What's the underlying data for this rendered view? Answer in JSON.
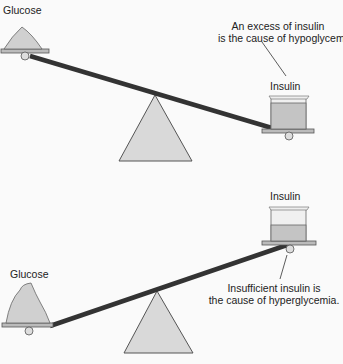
{
  "top_scale": {
    "left_label": "Glucose",
    "right_label": "Insulin",
    "annotation_line1": "An excess of insulin",
    "annotation_line2": "is the cause of hypoglycemia."
  },
  "bottom_scale": {
    "left_label": "Glucose",
    "right_label": "Insulin",
    "annotation_line1": "Insufficient insulin is",
    "annotation_line2": "the cause of hyperglycemia."
  },
  "colors": {
    "beam": "#333333",
    "fulcrum_fill": "#d6d6d6",
    "fulcrum_stroke": "#555555",
    "liquid": "#bdbdbd",
    "glucose": "#cfcfcf"
  }
}
